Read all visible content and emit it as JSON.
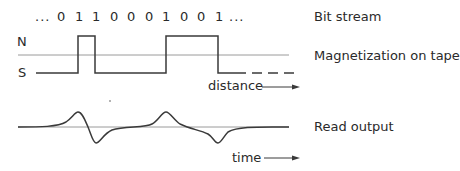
{
  "bit_stream": {
    "prefix": "...",
    "bits": [
      "0",
      "1",
      "1",
      "0",
      "0",
      "0",
      "1",
      "0",
      "0",
      "1"
    ],
    "suffix": "..."
  },
  "magnetization": {
    "north_label": "N",
    "south_label": "S",
    "axis_label": "distance"
  },
  "read_output": {
    "axis_label": "time"
  },
  "legend": {
    "bit_stream": "Bit stream",
    "magnetization": "Magnetization on tape",
    "read_output": "Read output"
  },
  "colors": {
    "line": "#3a3a3a",
    "centerline": "#9a9a9a",
    "text": "#2a2a2a"
  }
}
